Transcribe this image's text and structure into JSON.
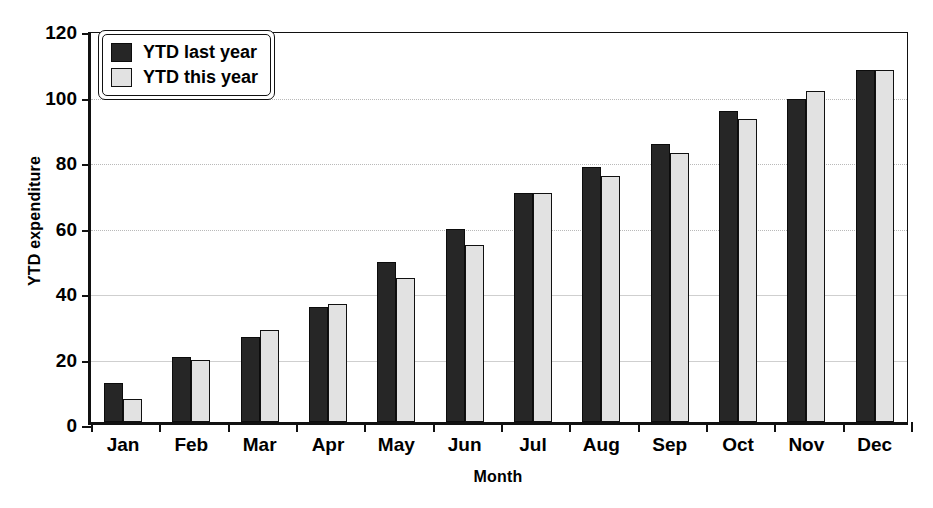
{
  "chart_data": {
    "type": "bar",
    "title": "",
    "xlabel": "Month",
    "ylabel": "YTD expenditure",
    "ylim": [
      0,
      120
    ],
    "ytick_step": 20,
    "yticks": [
      0,
      20,
      40,
      60,
      80,
      100,
      120
    ],
    "grid": true,
    "legend_position": "top-left",
    "categories": [
      "Jan",
      "Feb",
      "Mar",
      "Apr",
      "May",
      "Jun",
      "Jul",
      "Aug",
      "Sep",
      "Oct",
      "Nov",
      "Dec"
    ],
    "series": [
      {
        "name": "YTD last year",
        "color": "#262626",
        "values": [
          12,
          20,
          26,
          35,
          49,
          59,
          70,
          78,
          85,
          95,
          98.5,
          107.5
        ]
      },
      {
        "name": "YTD this year",
        "color": "#e2e2e2",
        "values": [
          7,
          19,
          28,
          36,
          44,
          54,
          70,
          75,
          82,
          92.5,
          101,
          107.5
        ]
      }
    ]
  }
}
